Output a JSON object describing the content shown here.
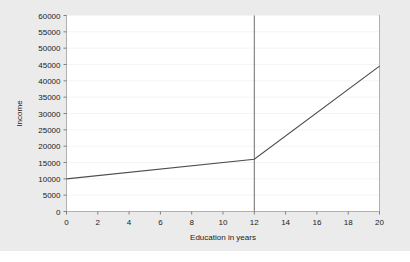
{
  "figure": {
    "background_color": "#ebebeb",
    "plot_background_color": "#ffffff",
    "outer_background_color": "#ffffff"
  },
  "chart_data": {
    "type": "line",
    "title": "",
    "xlabel": "Education in years",
    "ylabel": "Income",
    "xlim": [
      0,
      20
    ],
    "ylim": [
      0,
      60000
    ],
    "xticks": [
      0,
      2,
      4,
      6,
      8,
      10,
      12,
      14,
      16,
      18,
      20
    ],
    "xtick_labels": [
      "0",
      "2",
      "4",
      "6",
      "8",
      "10",
      "12",
      "14",
      "16",
      "18",
      "20"
    ],
    "yticks": [
      0,
      5000,
      10000,
      15000,
      20000,
      25000,
      30000,
      35000,
      40000,
      45000,
      50000,
      55000,
      60000
    ],
    "ytick_labels": [
      "0",
      "5000",
      "10000",
      "15000",
      "20000",
      "25000",
      "30000",
      "35000",
      "40000",
      "45000",
      "50000",
      "55000",
      "60000"
    ],
    "grid": "horizontal-only",
    "grid_color": "#f4f4f4",
    "legend": "none",
    "line_color": "#4d4d4d",
    "series": [
      {
        "name": "Predicted income",
        "x": [
          0,
          12,
          20
        ],
        "values": [
          10000,
          16000,
          44500
        ]
      }
    ],
    "annotations": [
      {
        "type": "vertical-reference-line",
        "x": 12,
        "label": "knot at 12 years",
        "color": "#6e6e6e"
      }
    ]
  }
}
